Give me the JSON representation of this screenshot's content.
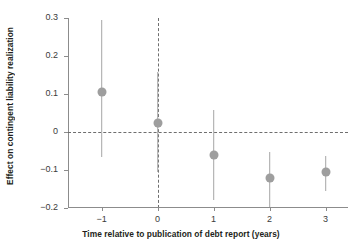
{
  "chart_data": {
    "type": "scatter",
    "title": "",
    "xlabel": "Time relative to publication of debt report (years)",
    "ylabel": "Effect on contingent liability realization",
    "x": [
      -1,
      0,
      1,
      2,
      3
    ],
    "xtick_labels": [
      "−1",
      "0",
      "1",
      "2",
      "3"
    ],
    "ytick_labels": [
      "0.3",
      "0.2",
      "0.1",
      "0",
      "−0.1",
      "−0.2"
    ],
    "ytick_values": [
      0.3,
      0.2,
      0.1,
      0,
      -0.1,
      -0.2
    ],
    "xlim": [
      -1.6,
      3.4
    ],
    "ylim": [
      -0.2,
      0.3
    ],
    "grid": false,
    "legend": null,
    "reference_lines": {
      "horizontal_zero": 0,
      "vertical_event": 0,
      "style": "dashed"
    },
    "series": [
      {
        "name": "Effect on contingent liability realization",
        "marker": "circle",
        "color": "#9e9e9e",
        "error_color": "#a6a6a6",
        "points": [
          {
            "x": -1,
            "y": 0.105,
            "ci_low": -0.066,
            "ci_high": 0.295
          },
          {
            "x": 0,
            "y": 0.024,
            "ci_low": -0.105,
            "ci_high": 0.158
          },
          {
            "x": 1,
            "y": -0.06,
            "ci_low": -0.179,
            "ci_high": 0.058
          },
          {
            "x": 2,
            "y": -0.122,
            "ci_low": -0.197,
            "ci_high": -0.052
          },
          {
            "x": 3,
            "y": -0.105,
            "ci_low": -0.155,
            "ci_high": -0.063
          }
        ]
      }
    ]
  },
  "colors": {
    "axis": "#8c8c8c",
    "reference": "#6e6e6e",
    "marker": "#9e9e9e",
    "error": "#a6a6a6",
    "text": "#231f20",
    "tick_text": "#3b3b3b",
    "background": "#ffffff"
  }
}
